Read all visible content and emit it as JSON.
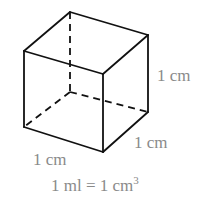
{
  "diagram": {
    "type": "cube",
    "labels": {
      "height": "1 cm",
      "depth": "1 cm",
      "width": "1 cm",
      "equation_prefix": "1 ml = 1 cm",
      "equation_exponent": "3"
    },
    "colors": {
      "edge": "#111111",
      "label": "#8a8a8a"
    }
  }
}
